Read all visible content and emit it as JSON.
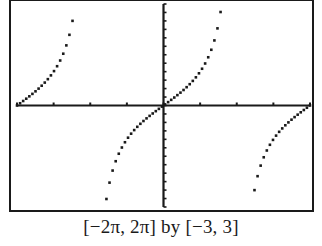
{
  "caption": "[−2π, 2π] by [−3, 3]",
  "colors": {
    "ink": "#1a1a1a",
    "background": "#ffffff"
  },
  "chart_data": {
    "type": "scatter",
    "title": "",
    "function": "y = tan(x/2)",
    "xlabel": "",
    "ylabel": "",
    "xlim": [
      -6.2832,
      6.2832
    ],
    "ylim": [
      -3,
      3
    ],
    "xscl": 1.5708,
    "yscl": 0.25,
    "grid": false,
    "legend": "none",
    "caption": "[−2π, 2π] by [−3, 3]",
    "sample_points": [
      {
        "x": -6.1,
        "y": 0.09
      },
      {
        "x": -5.5,
        "y": 0.41
      },
      {
        "x": -5.0,
        "y": 0.75
      },
      {
        "x": -4.5,
        "y": 1.24
      },
      {
        "x": -4.2,
        "y": 1.71
      },
      {
        "x": -3.9,
        "y": 2.58
      },
      {
        "x": -2.5,
        "y": -3.0
      },
      {
        "x": -2.0,
        "y": -1.56
      },
      {
        "x": -1.5,
        "y": -0.93
      },
      {
        "x": -1.0,
        "y": -0.55
      },
      {
        "x": -0.5,
        "y": -0.26
      },
      {
        "x": 0.0,
        "y": 0.0
      },
      {
        "x": 0.5,
        "y": 0.26
      },
      {
        "x": 1.0,
        "y": 0.55
      },
      {
        "x": 1.5,
        "y": 0.93
      },
      {
        "x": 2.0,
        "y": 1.56
      },
      {
        "x": 2.5,
        "y": 3.0
      },
      {
        "x": 3.9,
        "y": -2.58
      },
      {
        "x": 4.2,
        "y": -1.71
      },
      {
        "x": 4.5,
        "y": -1.24
      },
      {
        "x": 5.0,
        "y": -0.75
      },
      {
        "x": 5.5,
        "y": -0.41
      },
      {
        "x": 6.1,
        "y": -0.09
      }
    ]
  }
}
